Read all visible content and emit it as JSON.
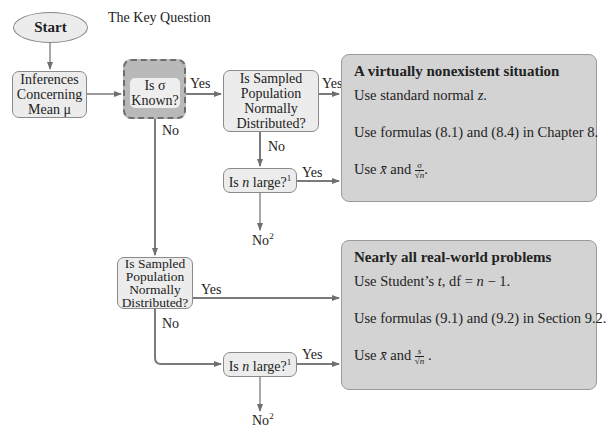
{
  "diagram": {
    "type": "flowchart",
    "key_question_label": "The Key Question",
    "nodes": {
      "start": {
        "label": "Start"
      },
      "inferences": {
        "lines": [
          "Inferences",
          "Concerning",
          "Mean μ"
        ]
      },
      "sigma_known": {
        "lines": [
          "Is σ",
          "Known?"
        ]
      },
      "normal_top": {
        "lines": [
          "Is Sampled",
          "Population",
          "Normally",
          "Distributed?"
        ]
      },
      "n_large_top": {
        "prefix": "Is ",
        "var": "n",
        "suffix": " large?",
        "sup": "1"
      },
      "no2_top": {
        "label": "No",
        "sup": "2"
      },
      "normal_bottom": {
        "lines": [
          "Is Sampled",
          "Population",
          "Normally",
          "Distributed?"
        ]
      },
      "n_large_bottom": {
        "prefix": "Is ",
        "var": "n",
        "suffix": " large?",
        "sup": "1"
      },
      "no2_bottom": {
        "label": "No",
        "sup": "2"
      }
    },
    "edge_labels": {
      "sigma_yes": "Yes",
      "sigma_no": "No",
      "normal_top_yes": "Yes",
      "normal_top_no": "No",
      "n_large_top_yes": "Yes",
      "normal_bottom_yes": "Yes",
      "normal_bottom_no": "No",
      "n_large_bottom_yes": "Yes"
    },
    "results": {
      "top": {
        "title": "A virtually nonexistent situation",
        "line1_prefix": "Use standard normal ",
        "line1_var": "z",
        "line1_suffix": ".",
        "line2": "Use formulas (8.1) and (8.4) in Chapter 8.",
        "line3_prefix": "Use ",
        "line3_xbar": "x̄",
        "line3_and": " and ",
        "line3_num": "σ",
        "line3_den": "√n",
        "line3_suffix": "."
      },
      "bottom": {
        "title": "Nearly all real-world problems",
        "line1_prefix": "Use Student’s ",
        "line1_var": "t",
        "line1_mid": ", df = ",
        "line1_expr": "n",
        "line1_suffix": " − 1.",
        "line2": "Use formulas (9.1) and (9.2) in Section 9.2.",
        "line3_prefix": "Use ",
        "line3_xbar": "x̄",
        "line3_and": " and ",
        "line3_num": "s",
        "line3_den": "√n",
        "line3_suffix": " ."
      }
    },
    "colors": {
      "node_fill": "#ececec",
      "key_fill": "#b9b9b9",
      "result_fill": "#d3d3d3",
      "line": "#7a7a7a"
    }
  }
}
